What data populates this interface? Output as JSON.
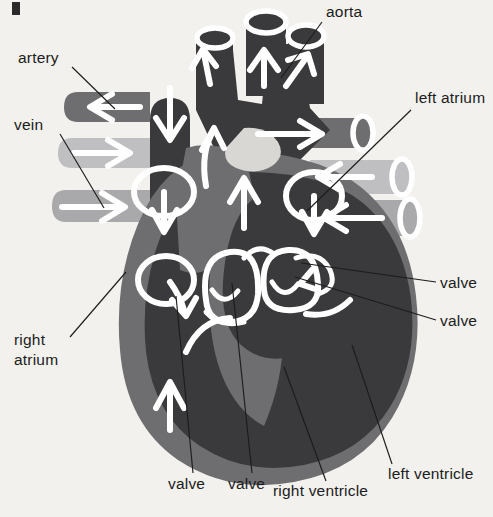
{
  "figure": {
    "background_color": "#f2f1ee",
    "corner_mark": "▌"
  },
  "palette": {
    "background": "#f2f1ee",
    "deoxygenated_dark": "#3a3a3c",
    "myocardium_mid": "#6e6e70",
    "vessel_light": "#a9a9ab",
    "vessel_pale": "#bfbfc1",
    "flow_arrow": "#ffffff",
    "label_text": "#1c1c1c",
    "leader_line": "#1c1c1c"
  },
  "labels": [
    {
      "id": "artery",
      "text": "artery",
      "text_x": 18,
      "text_y": 63,
      "anchor": "start",
      "leader": "M 72 67 L 115 109"
    },
    {
      "id": "vein",
      "text": "vein",
      "text_x": 14,
      "text_y": 130,
      "anchor": "start",
      "leader": "M 60 134 L 104 208"
    },
    {
      "id": "right-atrium-line1",
      "text": "right",
      "text_x": 14,
      "text_y": 345,
      "anchor": "start",
      "leader": "M 70 337 L 126 272"
    },
    {
      "id": "right-atrium-line2",
      "text": "atrium",
      "text_x": 14,
      "text_y": 365,
      "anchor": "start",
      "leader": ""
    },
    {
      "id": "aorta",
      "text": "aorta",
      "text_x": 326,
      "text_y": 17,
      "anchor": "start",
      "leader": "M 322 22 L 281 78"
    },
    {
      "id": "left-atrium",
      "text": "left atrium",
      "text_x": 415,
      "text_y": 103,
      "anchor": "start",
      "leader": "M 411 110 L 307 211"
    },
    {
      "id": "valve-right-upper",
      "text": "valve",
      "text_x": 440,
      "text_y": 288,
      "anchor": "start",
      "leader": "M 436 282 L 301 263"
    },
    {
      "id": "valve-right-lower",
      "text": "valve",
      "text_x": 440,
      "text_y": 326,
      "anchor": "start",
      "leader": "M 436 320 L 295 277"
    },
    {
      "id": "left-ventricle",
      "text": "left ventricle",
      "text_x": 388,
      "text_y": 479,
      "anchor": "start",
      "leader": "M 392 464 L 352 345"
    },
    {
      "id": "right-ventricle",
      "text": "right ventricle",
      "text_x": 273,
      "text_y": 496,
      "anchor": "start",
      "leader": "M 326 481 L 284 367"
    },
    {
      "id": "valve-bottom-left",
      "text": "valve",
      "text_x": 168,
      "text_y": 489,
      "anchor": "start",
      "leader": "M 193 473 L 176 296"
    },
    {
      "id": "valve-bottom-right",
      "text": "valve",
      "text_x": 228,
      "text_y": 489,
      "anchor": "start",
      "leader": "M 252 473 L 232 283"
    }
  ],
  "anatomy": {
    "chambers": [
      {
        "id": "right-atrium",
        "shade": "deoxygenated_dark"
      },
      {
        "id": "right-ventricle",
        "shade": "deoxygenated_dark"
      },
      {
        "id": "left-atrium",
        "shade": "deoxygenated_dark"
      },
      {
        "id": "left-ventricle",
        "shade": "deoxygenated_dark"
      },
      {
        "id": "myocardium",
        "shade": "myocardium_mid"
      }
    ],
    "vessels": [
      {
        "id": "aorta",
        "shade": "deoxygenated_dark",
        "flow": "up"
      },
      {
        "id": "pulmonary-trunk-left",
        "shade": "deoxygenated_dark",
        "flow": "up"
      },
      {
        "id": "pulmonary-trunk-middle",
        "shade": "deoxygenated_dark",
        "flow": "up"
      },
      {
        "id": "pulmonary-trunk-right",
        "shade": "deoxygenated_dark",
        "flow": "up"
      },
      {
        "id": "superior-vena-cava",
        "shade": "deoxygenated_dark",
        "flow": "down"
      },
      {
        "id": "inferior-vena-cava",
        "shade": "deoxygenated_dark",
        "flow": "up"
      },
      {
        "id": "left-artery",
        "shade": "myocardium_mid",
        "flow": "left"
      },
      {
        "id": "left-vein-upper",
        "shade": "vessel_light",
        "flow": "right"
      },
      {
        "id": "left-vein-lower",
        "shade": "vessel_light",
        "flow": "right"
      },
      {
        "id": "right-artery",
        "shade": "myocardium_mid",
        "flow": "right"
      },
      {
        "id": "right-vein-upper",
        "shade": "vessel_light",
        "flow": "left"
      },
      {
        "id": "right-vein-lower",
        "shade": "vessel_light",
        "flow": "left"
      },
      {
        "id": "pulmonary-artery-column",
        "shade": "myocardium_mid",
        "flow": "up"
      }
    ],
    "flow_arrows": [
      {
        "id": "svc-down",
        "direction": "down"
      },
      {
        "id": "ivc-up",
        "direction": "up"
      },
      {
        "id": "aorta-up-left",
        "direction": "up"
      },
      {
        "id": "aorta-up-middle",
        "direction": "up"
      },
      {
        "id": "aorta-up-right",
        "direction": "up"
      },
      {
        "id": "pulmonary-up-1",
        "direction": "up"
      },
      {
        "id": "pulmonary-up-2",
        "direction": "up"
      },
      {
        "id": "left-artery-in",
        "direction": "left"
      },
      {
        "id": "left-vein-in-1",
        "direction": "right"
      },
      {
        "id": "left-vein-in-2",
        "direction": "right"
      },
      {
        "id": "right-artery-out",
        "direction": "right"
      },
      {
        "id": "right-vein-in-1",
        "direction": "left"
      },
      {
        "id": "right-vein-in-2",
        "direction": "left"
      },
      {
        "id": "right-atrium-swirl",
        "direction": "loop-down"
      },
      {
        "id": "right-ventricle-swirl",
        "direction": "loop-down"
      },
      {
        "id": "left-atrium-swirl",
        "direction": "loop-down"
      },
      {
        "id": "tricuspid-through",
        "direction": "curve"
      },
      {
        "id": "mitral-through",
        "direction": "curve"
      }
    ],
    "valve_cusps": [
      {
        "id": "tricuspid-valve"
      },
      {
        "id": "mitral-valve"
      }
    ]
  }
}
